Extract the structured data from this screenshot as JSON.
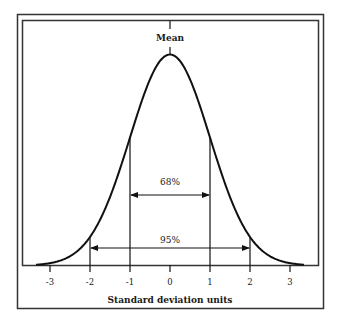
{
  "chart_data": {
    "type": "line",
    "title": "",
    "xlabel": "Standard deviation units",
    "ylabel": "",
    "x_ticks": [
      -3,
      -2,
      -1,
      0,
      1,
      2,
      3
    ],
    "x_tick_labels": [
      "-3",
      "-2",
      "-1",
      "0",
      "1",
      "2",
      "3"
    ],
    "xlim": [
      -3.35,
      3.35
    ],
    "grid": false,
    "series": [
      {
        "name": "Normal distribution",
        "distribution": "standard normal",
        "mean": 0,
        "sd": 1,
        "x": [
          -3,
          -2,
          -1,
          0,
          1,
          2,
          3
        ],
        "relative_density": [
          0.011,
          0.135,
          0.607,
          1.0,
          0.607,
          0.135,
          0.011
        ]
      }
    ],
    "annotations": [
      {
        "text": "Mean",
        "x": 0,
        "position": "above peak"
      },
      {
        "text": "68%",
        "from": -1,
        "to": 1,
        "type": "double-arrow"
      },
      {
        "text": "95%",
        "from": -2,
        "to": 2,
        "type": "double-arrow"
      }
    ]
  },
  "labels": {
    "mean": "Mean",
    "pct68": "68%",
    "pct95": "95%",
    "xlabel": "Standard deviation units",
    "ticks": [
      "-3",
      "-2",
      "-1",
      "0",
      "1",
      "2",
      "3"
    ]
  },
  "colors": {
    "line": "#111111",
    "frame": "#333333",
    "background": "#ffffff"
  }
}
